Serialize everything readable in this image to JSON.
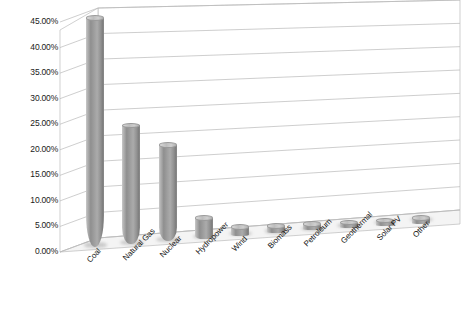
{
  "chart_data": {
    "type": "bar",
    "title": "",
    "subtitle": "",
    "xlabel": "",
    "ylabel": "",
    "categories": [
      "Coal",
      "Natural Gas",
      "Nuclear",
      "Hydropower",
      "Wind",
      "Biomass",
      "Petroleum",
      "Geothermal",
      "Solar PV",
      "Other"
    ],
    "values": [
      44.5,
      23.0,
      18.7,
      3.6,
      1.2,
      0.9,
      0.7,
      0.4,
      0.3,
      0.2
    ],
    "value_suffix": "%",
    "ylim": [
      0,
      45
    ],
    "ytick_labels": [
      "0.00%",
      "5.00%",
      "10.00%",
      "15.00%",
      "20.00%",
      "25.00%",
      "30.00%",
      "35.00%",
      "40.00%",
      "45.00%"
    ],
    "ytick_values": [
      0,
      5,
      10,
      15,
      20,
      25,
      30,
      35,
      40,
      45
    ],
    "grid": true,
    "legend": false,
    "legend_position": "none",
    "series_name": "Share of generation",
    "style": "3d-cylinder",
    "bar_color": "#9a9a9a"
  },
  "axis": {
    "y_label_color": "#1a1a1a",
    "x_label_color": "#141414",
    "gridline_color": "#b9b9b9",
    "wall_color": "#ffffff",
    "floor_color": "#f2f2f2"
  }
}
